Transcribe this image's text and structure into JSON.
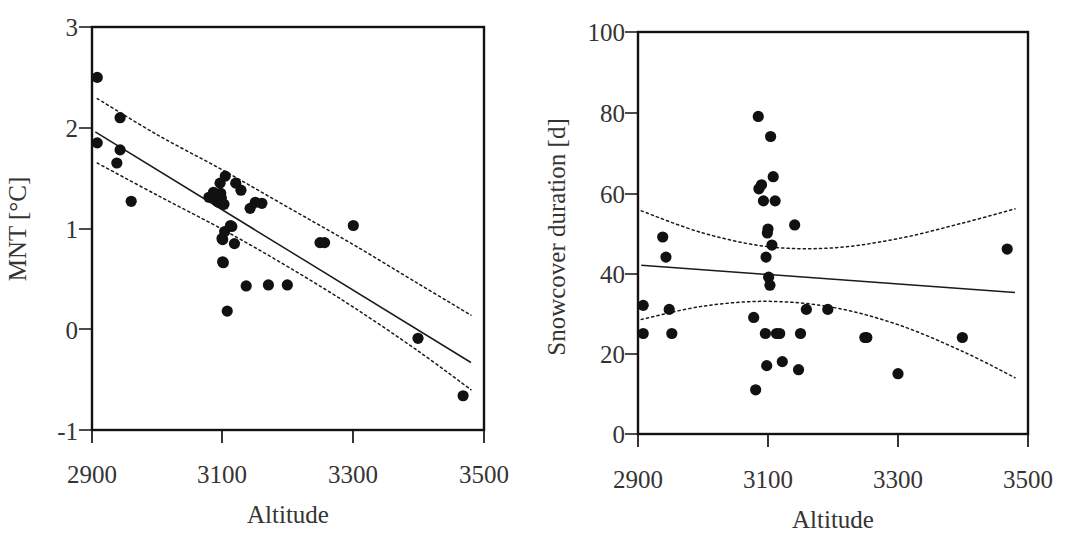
{
  "figure": {
    "width": 1071,
    "height": 540,
    "background": "#ffffff",
    "ink_color": "#121212",
    "point_color": "#111111",
    "panel_count": 2
  },
  "chart_data": [
    {
      "panel": "left",
      "type": "scatter",
      "title": "",
      "xlabel": "Altitude",
      "ylabel": "MNT [°C]",
      "xlim": [
        2900,
        3500
      ],
      "ylim": [
        -1,
        3
      ],
      "xticks": [
        2900,
        3100,
        3300,
        3500
      ],
      "xticklabels": [
        "2900",
        "3100",
        "3300",
        "3500"
      ],
      "yticks": [
        -1,
        0,
        1,
        2,
        3
      ],
      "yticklabels": [
        "-1",
        "0",
        "1",
        "2",
        "3"
      ],
      "grid": false,
      "legend": "none",
      "marker": "filled-circle",
      "marker_size": 7,
      "x": [
        2908,
        2908,
        2943,
        2943,
        2938,
        2960,
        3079,
        3086,
        3090,
        3092,
        3094,
        3096,
        3098,
        3099,
        3100,
        3100,
        3101,
        3102,
        3103,
        3104,
        3107,
        3112,
        3114,
        3118,
        3120,
        3128,
        3136,
        3142,
        3150,
        3160,
        3170,
        3199,
        3249,
        3256,
        3300,
        3399,
        3468,
        3086,
        3097
      ],
      "y": [
        2.5,
        1.85,
        2.1,
        1.78,
        1.65,
        1.27,
        1.31,
        1.36,
        1.29,
        1.27,
        1.26,
        1.45,
        1.3,
        0.9,
        0.89,
        0.67,
        0.66,
        1.24,
        0.97,
        1.52,
        0.18,
        1.03,
        1.02,
        0.85,
        1.45,
        1.38,
        0.43,
        1.2,
        1.26,
        1.25,
        0.44,
        0.44,
        0.86,
        0.86,
        1.03,
        -0.09,
        -0.66,
        1.33,
        1.35
      ],
      "fit_line": {
        "label": "regression",
        "style": "solid",
        "x": [
          2905,
          3480
        ],
        "y": [
          1.96,
          -0.33
        ]
      },
      "confidence_bands": [
        {
          "label": "upper-confidence",
          "style": "dotted",
          "x": [
            2908,
            3000,
            3100,
            3200,
            3300,
            3400,
            3480
          ],
          "y": [
            2.29,
            1.93,
            1.58,
            1.21,
            0.84,
            0.45,
            0.14
          ]
        },
        {
          "label": "lower-confidence",
          "style": "dotted",
          "x": [
            2908,
            3000,
            3100,
            3200,
            3300,
            3400,
            3480
          ],
          "y": [
            1.65,
            1.33,
            0.99,
            0.62,
            0.22,
            -0.22,
            -0.6
          ]
        }
      ]
    },
    {
      "panel": "right",
      "type": "scatter",
      "title": "",
      "xlabel": "Altitude",
      "ylabel": "Snowcover duration [d]",
      "xlim": [
        2900,
        3500
      ],
      "ylim": [
        0,
        100
      ],
      "xticks": [
        2900,
        3100,
        3300,
        3500
      ],
      "xticklabels": [
        "2900",
        "3100",
        "3300",
        "3500"
      ],
      "yticks": [
        0,
        20,
        40,
        60,
        80,
        100
      ],
      "yticklabels": [
        "0",
        "20",
        "40",
        "60",
        "80",
        "100"
      ],
      "grid": false,
      "legend": "none",
      "marker": "filled-circle",
      "marker_size": 7,
      "x": [
        2908,
        2908,
        2938,
        2943,
        2948,
        2952,
        3078,
        3081,
        3085,
        3086,
        3090,
        3093,
        3096,
        3097,
        3098,
        3099,
        3100,
        3101,
        3103,
        3104,
        3106,
        3108,
        3111,
        3113,
        3118,
        3122,
        3141,
        3147,
        3150,
        3159,
        3192,
        3249,
        3252,
        3300,
        3399,
        3468
      ],
      "y": [
        32,
        25,
        49,
        44,
        31,
        25,
        29,
        11,
        79,
        61,
        62,
        58,
        25,
        44,
        17,
        50,
        51,
        39,
        37,
        74,
        47,
        64,
        58,
        25,
        25,
        18,
        52,
        16,
        25,
        31,
        31,
        24,
        24,
        15,
        24,
        46
      ],
      "fit_line": {
        "label": "regression",
        "style": "solid",
        "x": [
          2905,
          3480
        ],
        "y": [
          42.0,
          35.2
        ]
      },
      "confidence_bands": [
        {
          "label": "upper-confidence",
          "style": "dotted",
          "x": [
            2905,
            3000,
            3100,
            3200,
            3300,
            3400,
            3480
          ],
          "y": [
            55.5,
            50.0,
            46.6,
            46.3,
            48.6,
            52.5,
            56.0
          ]
        },
        {
          "label": "lower-confidence",
          "style": "dotted",
          "x": [
            2905,
            3000,
            3100,
            3200,
            3300,
            3400,
            3480
          ],
          "y": [
            28.5,
            31.8,
            33.0,
            31.5,
            27.2,
            20.5,
            14.0
          ]
        }
      ]
    }
  ]
}
